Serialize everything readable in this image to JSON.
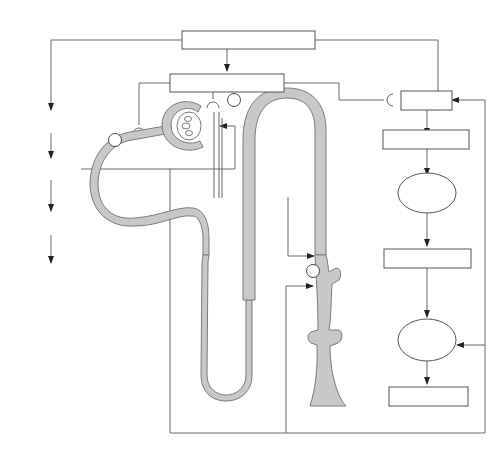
{
  "diagram": {
    "colors": {
      "line": "#666666",
      "box_border": "#555555",
      "tubule_fill": "#c8c8c8",
      "text": "#1a1a1a",
      "background": "#ffffff"
    },
    "nodes": {
      "volume_expansion": "Volume expansion",
      "sympathetic_activity": "↓ Sympathetic activity",
      "renin": "↓ Renin",
      "angiotensin_1": "↓ Angiotensin I",
      "lung": "Lung",
      "angiotensin_2": "↓ Angiotensin II",
      "adrenal_gland_line1": "Adrenal",
      "adrenal_gland_line2": "gland",
      "aldosterone": "↓ Aldosterone",
      "heart": "Heart",
      "anp": "↑ ANP",
      "brain": "Brain",
      "adh": "↓ ADH",
      "urodilatin": "Urodilatin",
      "excretion_line1": "↑ Na⁺, H₂O",
      "excretion_line2": "excretion"
    },
    "markers": {
      "site_1": "1",
      "site_2": "2",
      "site_3": "3"
    },
    "edges": [
      {
        "from": "Volume expansion",
        "to": "↓ Sympathetic activity"
      },
      {
        "from": "Volume expansion",
        "to": "↓ Renin"
      },
      {
        "from": "Volume expansion",
        "to": "Heart"
      },
      {
        "from": "↓ Sympathetic activity",
        "to": "site 1 (afferent arteriole)",
        "type": "synapse"
      },
      {
        "from": "↓ Sympathetic activity",
        "to": "site 2 (proximal tubule)",
        "type": "synapse"
      },
      {
        "from": "↓ Sympathetic activity",
        "to": "↓ Renin",
        "type": "synapse"
      },
      {
        "from": "↓ Renin",
        "to": "↓ Angiotensin I"
      },
      {
        "from": "↓ Angiotensin I",
        "to": "Lung"
      },
      {
        "from": "Lung",
        "to": "↓ Angiotensin II"
      },
      {
        "from": "↓ Angiotensin II",
        "to": "Adrenal gland"
      },
      {
        "from": "Adrenal gland",
        "to": "↓ Aldosterone"
      },
      {
        "from": "Heart",
        "to": "↑ ANP"
      },
      {
        "from": "↑ ANP",
        "to": "site 1 (afferent arteriole)"
      },
      {
        "from": "↑ ANP",
        "to": "Brain"
      },
      {
        "from": "↑ ANP",
        "to": "site 3 (collecting duct)"
      },
      {
        "from": "↑ ANP",
        "to": "↓ Renin"
      },
      {
        "from": "↑ ANP",
        "to": "Adrenal gland"
      },
      {
        "from": "Brain",
        "to": "↓ ADH"
      },
      {
        "from": "Urodilatin",
        "to": "collecting duct"
      }
    ],
    "caption": "▪ ▪▪ ▪▪▪ ▪▪ ▪▪▪ ▪ ▪▪ ▪▪ ▪▪▪ ▪ ▪▪ ▪▪ ▪▪ ▪▪ ▪▪▪ ▪ ▪▪ ▪▪▪ ▪▪ ▪▪ ▪"
  }
}
